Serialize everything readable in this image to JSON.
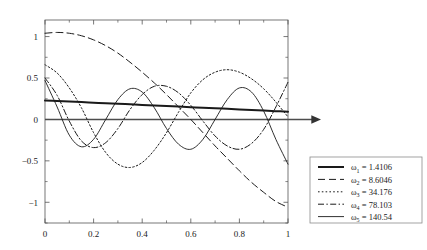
{
  "chart_data": {
    "type": "line",
    "title": "",
    "xlabel": "",
    "ylabel": "",
    "xlim": [
      0,
      1
    ],
    "ylim": [
      -1.25,
      1.2
    ],
    "xticks": [
      "0",
      "0.2",
      "0.4",
      "0.6",
      "0.8",
      "1"
    ],
    "xtick_values": [
      0,
      0.2,
      0.4,
      0.6,
      0.8,
      1
    ],
    "yticks": [
      "1",
      "0.5",
      "0",
      "-0.5",
      "-1"
    ],
    "ytick_values": [
      1,
      0.5,
      0,
      -0.5,
      -1
    ],
    "grid": false,
    "legend_position": "right-outside",
    "zero_line": true,
    "zero_line_arrow": true,
    "series": [
      {
        "name": "w1",
        "label": "ω",
        "subscript": "1",
        "value": "1.4106",
        "legend_text": " = 1.4106",
        "style": "solid",
        "width": 2.0,
        "color": "#1a1a1a",
        "x": [
          0,
          0.05,
          0.1,
          0.15,
          0.2,
          0.25,
          0.3,
          0.35,
          0.4,
          0.45,
          0.5,
          0.55,
          0.6,
          0.65,
          0.7,
          0.75,
          0.8,
          0.85,
          0.9,
          0.95,
          1
        ],
        "y": [
          0.228,
          0.222,
          0.215,
          0.209,
          0.202,
          0.195,
          0.189,
          0.182,
          0.175,
          0.169,
          0.162,
          0.155,
          0.148,
          0.141,
          0.135,
          0.128,
          0.121,
          0.114,
          0.107,
          0.1,
          0.093
        ]
      },
      {
        "name": "w2",
        "label": "ω",
        "subscript": "2",
        "value": "8.6046",
        "legend_text": " = 8.6046",
        "style": "dashed",
        "width": 1.0,
        "color": "#1a1a1a",
        "x": [
          0,
          0.05,
          0.1,
          0.15,
          0.2,
          0.25,
          0.3,
          0.35,
          0.4,
          0.45,
          0.5,
          0.55,
          0.6,
          0.65,
          0.7,
          0.75,
          0.8,
          0.85,
          0.9,
          0.95,
          1
        ],
        "y": [
          1.04,
          1.05,
          1.04,
          1.01,
          0.96,
          0.89,
          0.8,
          0.69,
          0.57,
          0.44,
          0.3,
          0.15,
          0.0,
          -0.16,
          -0.32,
          -0.47,
          -0.62,
          -0.76,
          -0.88,
          -0.99,
          -1.06
        ]
      },
      {
        "name": "w3",
        "label": "ω",
        "subscript": "3",
        "value": "34.176",
        "legend_text": " = 34.176",
        "style": "dotted",
        "width": 1.0,
        "color": "#1a1a1a",
        "x": [
          0,
          0.05,
          0.1,
          0.15,
          0.2,
          0.25,
          0.3,
          0.35,
          0.4,
          0.45,
          0.5,
          0.55,
          0.6,
          0.65,
          0.7,
          0.75,
          0.8,
          0.85,
          0.9,
          0.95,
          1
        ],
        "y": [
          0.66,
          0.56,
          0.38,
          0.14,
          -0.16,
          -0.4,
          -0.54,
          -0.58,
          -0.52,
          -0.37,
          -0.16,
          0.09,
          0.32,
          0.48,
          0.57,
          0.6,
          0.57,
          0.49,
          0.37,
          0.21,
          0.03
        ]
      },
      {
        "name": "w4",
        "label": "ω",
        "subscript": "4",
        "value": "78.103",
        "legend_text": " = 78.103",
        "style": "dashdot",
        "width": 1.0,
        "color": "#1a1a1a",
        "x": [
          0,
          0.05,
          0.1,
          0.15,
          0.2,
          0.25,
          0.3,
          0.35,
          0.4,
          0.45,
          0.5,
          0.55,
          0.6,
          0.65,
          0.7,
          0.75,
          0.8,
          0.85,
          0.9,
          0.95,
          1
        ],
        "y": [
          0.5,
          0.29,
          -0.02,
          -0.26,
          -0.34,
          -0.28,
          -0.11,
          0.12,
          0.3,
          0.4,
          0.4,
          0.32,
          0.17,
          -0.02,
          -0.2,
          -0.32,
          -0.36,
          -0.29,
          -0.12,
          0.15,
          0.45
        ]
      },
      {
        "name": "w5",
        "label": "ω",
        "subscript": "5",
        "value": "140.54",
        "legend_text": " = 140.54",
        "style": "solid",
        "width": 0.9,
        "color": "#1a1a1a",
        "x": [
          0,
          0.05,
          0.1,
          0.15,
          0.2,
          0.25,
          0.3,
          0.35,
          0.4,
          0.45,
          0.5,
          0.55,
          0.6,
          0.65,
          0.7,
          0.75,
          0.8,
          0.85,
          0.9,
          0.95,
          1
        ],
        "y": [
          0.47,
          0.15,
          -0.19,
          -0.33,
          -0.24,
          0.0,
          0.24,
          0.37,
          0.33,
          0.14,
          -0.11,
          -0.3,
          -0.36,
          -0.24,
          0.0,
          0.24,
          0.38,
          0.33,
          0.1,
          -0.24,
          -0.54
        ]
      }
    ]
  },
  "legend": {
    "items": [
      {
        "sym": "ω",
        "sub": "1",
        "eq": " = 1.4106"
      },
      {
        "sym": "ω",
        "sub": "2",
        "eq": " = 8.6046"
      },
      {
        "sym": "ω",
        "sub": "3",
        "eq": " = 34.176"
      },
      {
        "sym": "ω",
        "sub": "4",
        "eq": " = 78.103"
      },
      {
        "sym": "ω",
        "sub": "5",
        "eq": " = 140.54"
      }
    ]
  },
  "colors": {
    "line": "#1a1a1a",
    "axis": "#555555",
    "zero_axis": "#4d4d4d",
    "legend_border": "#8c8c8c",
    "background": "#ffffff"
  }
}
